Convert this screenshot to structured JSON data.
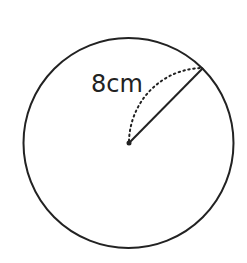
{
  "diagram": {
    "type": "circle-radius",
    "radius_label": "8cm",
    "colors": {
      "stroke": "#222222",
      "background": "#ffffff"
    },
    "circle": {
      "cx": 128.5,
      "cy": 143,
      "r": 105
    },
    "center_point": {
      "x": 129,
      "y": 143
    },
    "radius_endpoint": {
      "x": 203,
      "y": 68
    },
    "dotted_arc": {
      "from": "center",
      "to": "radius-endpoint",
      "style": "dotted"
    }
  }
}
